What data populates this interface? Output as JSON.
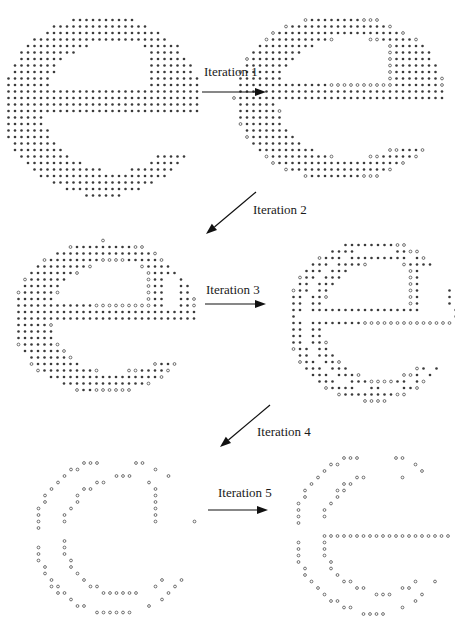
{
  "figure": {
    "dot_legend": {
      "filled": "*",
      "hollow": "o"
    },
    "colors": {
      "dot": "#3a3a3a",
      "text": "#1a1a1a",
      "arrow": "#111111"
    },
    "panels": [
      {
        "id": "original",
        "x": 0,
        "y": 5,
        "w": 200,
        "h": 190,
        "spacing": 6.5,
        "fill_level": 1.0,
        "hollow_outline": false
      },
      {
        "id": "after-1",
        "x": 232,
        "y": 5,
        "w": 212,
        "h": 175,
        "spacing": 6.5,
        "fill_level": 0.8,
        "hollow_outline": true
      },
      {
        "id": "after-2",
        "x": 10,
        "y": 232,
        "w": 185,
        "h": 160,
        "spacing": 6.5,
        "fill_level": 0.5,
        "hollow_outline": true
      },
      {
        "id": "after-3",
        "x": 285,
        "y": 230,
        "w": 170,
        "h": 170,
        "spacing": 6.5,
        "fill_level": 0.25,
        "hollow_outline": true
      },
      {
        "id": "after-4",
        "x": 30,
        "y": 448,
        "w": 165,
        "h": 165,
        "spacing": 6.5,
        "fill_level": 0.0,
        "hollow_outline": true
      },
      {
        "id": "after-5",
        "x": 290,
        "y": 443,
        "w": 162,
        "h": 170,
        "spacing": 6.5,
        "fill_level": 0.0,
        "hollow_outline": true
      }
    ],
    "steps": [
      {
        "label": "Iteration 1",
        "label_x": 204,
        "label_y": 64,
        "arrow": {
          "x1": 202,
          "y1": 92,
          "x2": 266,
          "y2": 92
        }
      },
      {
        "label": "Iteration 2",
        "label_x": 253,
        "label_y": 202,
        "arrow": {
          "x1": 256,
          "y1": 192,
          "x2": 206,
          "y2": 234
        }
      },
      {
        "label": "Iteration 3",
        "label_x": 206,
        "label_y": 282,
        "arrow": {
          "x1": 205,
          "y1": 304,
          "x2": 266,
          "y2": 304
        }
      },
      {
        "label": "Iteration 4",
        "label_x": 257,
        "label_y": 424,
        "arrow": {
          "x1": 270,
          "y1": 405,
          "x2": 220,
          "y2": 447
        }
      },
      {
        "label": "Iteration 5",
        "label_x": 218,
        "label_y": 485,
        "arrow": {
          "x1": 208,
          "y1": 510,
          "x2": 268,
          "y2": 510
        }
      }
    ],
    "caption_fragment": ""
  }
}
